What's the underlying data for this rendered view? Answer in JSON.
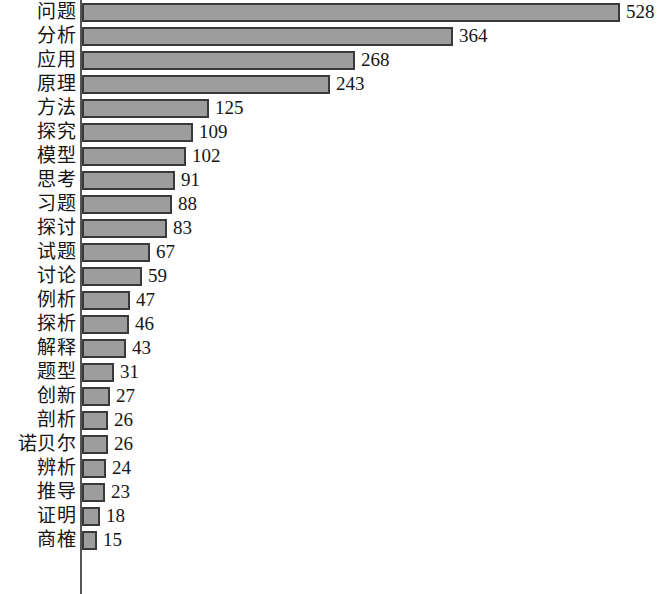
{
  "chart_data": {
    "type": "bar",
    "orientation": "horizontal",
    "title": "",
    "subtitle": "",
    "xlabel": "",
    "ylabel": "",
    "grid": false,
    "legend": null,
    "legend_position": "none",
    "xlim": [
      0,
      528
    ],
    "axis_visible": "category-axis-only",
    "bar_fill_color": "#9d9d9d",
    "bar_border_color": "#3a3a3a",
    "background_color": "#ffffff",
    "text_color": "#151515",
    "value_labels_shown": true,
    "categories": [
      "问题",
      "分析",
      "应用",
      "原理",
      "方法",
      "探究",
      "模型",
      "思考",
      "习题",
      "探讨",
      "试题",
      "讨论",
      "例析",
      "探析",
      "解释",
      "题型",
      "创新",
      "剖析",
      "诺贝尔",
      "辨析",
      "推导",
      "证明",
      "商榷"
    ],
    "values": [
      528,
      364,
      268,
      243,
      125,
      109,
      102,
      91,
      88,
      83,
      67,
      59,
      47,
      46,
      43,
      31,
      27,
      26,
      26,
      24,
      23,
      18,
      15
    ]
  }
}
